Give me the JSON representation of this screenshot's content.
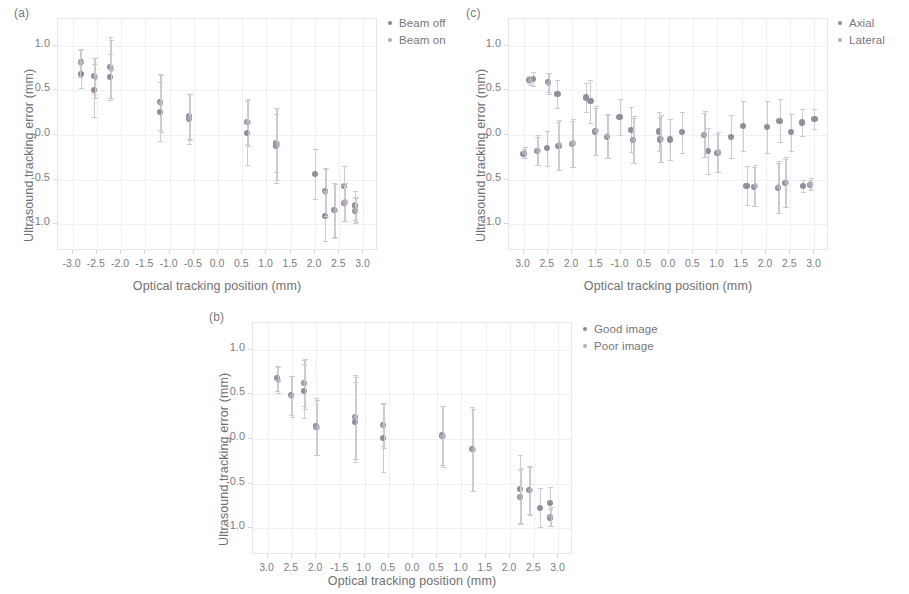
{
  "figure": {
    "colors": {
      "series_a": "#8e8795",
      "series_b": "#b6aec0",
      "errorbar": "#cfc9d4",
      "axis": "#e8e6ea",
      "grid": "#f1eff3",
      "text": "#6f6f76"
    }
  },
  "panels": [
    {
      "label": "(a)",
      "legend": [
        "Beam off",
        "Beam on"
      ]
    },
    {
      "label": "(b)",
      "legend": [
        "Good image",
        "Poor image"
      ]
    },
    {
      "label": "(c)",
      "legend": [
        "Axial",
        "Lateral"
      ]
    }
  ],
  "chart_data": [
    {
      "panel": "(a)",
      "type": "scatter",
      "title": "(a)",
      "xlabel": "Optical tracking position (mm)",
      "ylabel": "Ultrasound tracking error (mm)",
      "xlim": [
        -3.3,
        3.3
      ],
      "ylim": [
        -1.3,
        1.3
      ],
      "xticks": [
        -3.0,
        -2.5,
        -2.0,
        -1.5,
        -1.0,
        -0.5,
        0.0,
        0.5,
        1.0,
        1.5,
        2.0,
        2.5,
        3.0
      ],
      "xticklabels": [
        "-3.0",
        "-2.5",
        "-2.0",
        "-1.5",
        "-1.0",
        "-0.5",
        "0.0",
        "0.5",
        "1.0",
        "1.5",
        "2.0",
        "2.5",
        "3.0"
      ],
      "yticks": [
        1.0,
        0.5,
        0.0,
        -0.5,
        -1.0
      ],
      "yticklabels": [
        "1.0",
        "0.5",
        "0.0",
        "-0.5",
        "-1.0"
      ],
      "grid": true,
      "legend_position": "outside-right-top",
      "series": [
        {
          "name": "Beam off",
          "color": "#8e8795",
          "points": [
            {
              "x": -2.82,
              "y": 0.82,
              "err": 0.14
            },
            {
              "x": -2.82,
              "y": 0.68,
              "err": 0.15
            },
            {
              "x": -2.55,
              "y": 0.66,
              "err": 0.2
            },
            {
              "x": -2.55,
              "y": 0.5,
              "err": 0.3
            },
            {
              "x": -2.22,
              "y": 0.76,
              "err": 0.34
            },
            {
              "x": -2.22,
              "y": 0.65,
              "err": 0.26
            },
            {
              "x": -1.2,
              "y": 0.37,
              "err": 0.31
            },
            {
              "x": -1.2,
              "y": 0.26,
              "err": 0.33
            },
            {
              "x": -0.6,
              "y": 0.21,
              "err": 0.25
            },
            {
              "x": -0.6,
              "y": 0.18,
              "err": 0.28
            },
            {
              "x": 0.6,
              "y": 0.15,
              "err": 0.25
            },
            {
              "x": 0.6,
              "y": 0.02,
              "err": 0.36
            },
            {
              "x": 1.2,
              "y": -0.09,
              "err": 0.33
            },
            {
              "x": 1.2,
              "y": -0.12,
              "err": 0.42
            },
            {
              "x": 2.0,
              "y": -0.44,
              "err": 0.28
            },
            {
              "x": 2.2,
              "y": -0.63,
              "err": 0.25
            },
            {
              "x": 2.2,
              "y": -0.91,
              "err": 0.28
            },
            {
              "x": 2.4,
              "y": -0.84,
              "err": 0.3
            },
            {
              "x": 2.6,
              "y": -0.57,
              "err": 0.22
            },
            {
              "x": 2.6,
              "y": -0.76,
              "err": 0.2
            },
            {
              "x": 2.82,
              "y": -0.79,
              "err": 0.16
            },
            {
              "x": 2.82,
              "y": -0.85,
              "err": 0.14
            }
          ]
        },
        {
          "name": "Beam on",
          "color": "#b6aec0",
          "points": [
            {
              "x": -2.84,
              "y": 0.8,
              "err": 0.15
            },
            {
              "x": -2.53,
              "y": 0.64,
              "err": 0.22
            },
            {
              "x": -2.2,
              "y": 0.74,
              "err": 0.33
            },
            {
              "x": -1.18,
              "y": 0.35,
              "err": 0.32
            },
            {
              "x": -0.58,
              "y": 0.2,
              "err": 0.26
            },
            {
              "x": 0.62,
              "y": 0.14,
              "err": 0.26
            },
            {
              "x": 1.22,
              "y": -0.1,
              "err": 0.4
            },
            {
              "x": 2.22,
              "y": -0.64,
              "err": 0.27
            },
            {
              "x": 2.42,
              "y": -0.85,
              "err": 0.3
            },
            {
              "x": 2.62,
              "y": -0.75,
              "err": 0.21
            },
            {
              "x": 2.84,
              "y": -0.84,
              "err": 0.14
            }
          ]
        }
      ]
    },
    {
      "panel": "(b)",
      "type": "scatter",
      "title": "(b)",
      "xlabel": "Optical tracking position (mm)",
      "ylabel": "Ultrasound tracking error (mm)",
      "xlim": [
        -3.3,
        3.3
      ],
      "ylim": [
        -1.3,
        1.3
      ],
      "xticks": [
        -3.0,
        -2.5,
        -2.0,
        -1.5,
        -1.0,
        -0.5,
        0.0,
        0.5,
        1.0,
        1.5,
        2.0,
        2.5,
        3.0
      ],
      "xticklabels": [
        "3.0",
        "2.5",
        "2.0",
        "-1.5",
        "1.0",
        "0.5",
        "0.0",
        "0.5",
        "1.0",
        "1.5",
        "2.0",
        "2.5",
        "3.0"
      ],
      "yticks": [
        1.0,
        0.5,
        0.0,
        -0.5,
        -1.0
      ],
      "yticklabels": [
        "1.0",
        "0.5",
        "0.0",
        "-0.5",
        "-1.0"
      ],
      "grid": true,
      "legend_position": "outside-right-top",
      "series": [
        {
          "name": "Good image",
          "color": "#8e8795",
          "points": [
            {
              "x": -2.8,
              "y": 0.68,
              "err": 0.14
            },
            {
              "x": -2.52,
              "y": 0.49,
              "err": 0.22
            },
            {
              "x": -2.25,
              "y": 0.63,
              "err": 0.26
            },
            {
              "x": -2.25,
              "y": 0.54,
              "err": 0.3
            },
            {
              "x": -2.0,
              "y": 0.14,
              "err": 0.32
            },
            {
              "x": -1.2,
              "y": 0.25,
              "err": 0.47
            },
            {
              "x": -1.2,
              "y": 0.19,
              "err": 0.45
            },
            {
              "x": -0.62,
              "y": 0.16,
              "err": 0.24
            },
            {
              "x": -0.62,
              "y": 0.01,
              "err": 0.38
            },
            {
              "x": 0.6,
              "y": 0.04,
              "err": 0.33
            },
            {
              "x": 1.22,
              "y": -0.11,
              "err": 0.47
            },
            {
              "x": 2.2,
              "y": -0.56,
              "err": 0.38
            },
            {
              "x": 2.2,
              "y": -0.65,
              "err": 0.3
            },
            {
              "x": 2.4,
              "y": -0.57,
              "err": 0.27
            },
            {
              "x": 2.62,
              "y": -0.77,
              "err": 0.22
            },
            {
              "x": 2.82,
              "y": -0.72,
              "err": 0.18
            },
            {
              "x": 2.82,
              "y": -0.88,
              "err": 0.1
            }
          ]
        },
        {
          "name": "Poor image",
          "color": "#b6aec0",
          "points": [
            {
              "x": -2.78,
              "y": 0.66,
              "err": 0.15
            },
            {
              "x": -2.5,
              "y": 0.48,
              "err": 0.23
            },
            {
              "x": -2.23,
              "y": 0.62,
              "err": 0.28
            },
            {
              "x": -1.98,
              "y": 0.13,
              "err": 0.31
            },
            {
              "x": -1.18,
              "y": 0.24,
              "err": 0.46
            },
            {
              "x": -0.6,
              "y": 0.15,
              "err": 0.25
            },
            {
              "x": 0.62,
              "y": 0.03,
              "err": 0.34
            },
            {
              "x": 1.24,
              "y": -0.12,
              "err": 0.46
            },
            {
              "x": 2.22,
              "y": -0.64,
              "err": 0.31
            },
            {
              "x": 2.42,
              "y": -0.58,
              "err": 0.27
            },
            {
              "x": 2.84,
              "y": -0.87,
              "err": 0.11
            }
          ]
        }
      ]
    },
    {
      "panel": "(c)",
      "type": "scatter",
      "title": "(c)",
      "xlabel": "Optical tracking position (mm)",
      "ylabel": "Ultrasound tracking error (mm)",
      "xlim": [
        -3.3,
        3.3
      ],
      "ylim": [
        -1.3,
        1.3
      ],
      "xticks": [
        -3.0,
        -2.5,
        -2.0,
        -1.5,
        -1.0,
        -0.5,
        0.0,
        0.5,
        1.0,
        1.5,
        2.0,
        2.5,
        3.0
      ],
      "xticklabels": [
        "3.0",
        "2.5",
        "2.0",
        "1.5",
        "-1.0",
        "0.5",
        "0.0",
        "0.5",
        "1.0",
        "1.5",
        "2.0",
        "2.5",
        "3.0"
      ],
      "yticks": [
        1.0,
        0.5,
        0.0,
        -0.5,
        -1.0
      ],
      "yticklabels": [
        "1.0",
        "0.5",
        "0.0",
        "0.5",
        "-1.0"
      ],
      "grid": true,
      "legend_position": "outside-right-top",
      "series": [
        {
          "name": "Axial",
          "color": "#8e8795",
          "points": [
            {
              "x": -3.0,
              "y": -0.21,
              "err": 0.05
            },
            {
              "x": -2.88,
              "y": 0.62,
              "err": 0.04
            },
            {
              "x": -2.8,
              "y": 0.63,
              "err": 0.08
            },
            {
              "x": -2.72,
              "y": -0.18,
              "err": 0.16
            },
            {
              "x": -2.52,
              "y": -0.15,
              "err": 0.2
            },
            {
              "x": -2.5,
              "y": 0.59,
              "err": 0.11
            },
            {
              "x": -2.3,
              "y": 0.46,
              "err": 0.16
            },
            {
              "x": -2.28,
              "y": -0.12,
              "err": 0.27
            },
            {
              "x": -2.0,
              "y": -0.1,
              "err": 0.26
            },
            {
              "x": -1.72,
              "y": 0.42,
              "err": 0.16
            },
            {
              "x": -1.62,
              "y": 0.38,
              "err": 0.24
            },
            {
              "x": -1.52,
              "y": 0.04,
              "err": 0.26
            },
            {
              "x": -1.28,
              "y": -0.02,
              "err": 0.24
            },
            {
              "x": -1.02,
              "y": 0.2,
              "err": 0.2
            },
            {
              "x": -0.78,
              "y": 0.06,
              "err": 0.25
            },
            {
              "x": -0.75,
              "y": -0.06,
              "err": 0.25
            },
            {
              "x": -0.2,
              "y": 0.04,
              "err": 0.22
            },
            {
              "x": -0.18,
              "y": -0.05,
              "err": 0.25
            },
            {
              "x": 0.02,
              "y": -0.05,
              "err": 0.23
            },
            {
              "x": 0.26,
              "y": 0.03,
              "err": 0.23
            },
            {
              "x": 0.72,
              "y": 0.0,
              "err": 0.25
            },
            {
              "x": 0.8,
              "y": -0.18,
              "err": 0.26
            },
            {
              "x": 1.0,
              "y": -0.2,
              "err": 0.21
            },
            {
              "x": 1.28,
              "y": -0.02,
              "err": 0.24
            },
            {
              "x": 1.52,
              "y": 0.1,
              "err": 0.28
            },
            {
              "x": 1.6,
              "y": -0.57,
              "err": 0.22
            },
            {
              "x": 1.76,
              "y": -0.58,
              "err": 0.22
            },
            {
              "x": 2.02,
              "y": 0.09,
              "err": 0.29
            },
            {
              "x": 2.24,
              "y": -0.59,
              "err": 0.28
            },
            {
              "x": 2.28,
              "y": 0.16,
              "err": 0.24
            },
            {
              "x": 2.4,
              "y": -0.54,
              "err": 0.27
            },
            {
              "x": 2.52,
              "y": 0.03,
              "err": 0.21
            },
            {
              "x": 2.74,
              "y": 0.14,
              "err": 0.15
            },
            {
              "x": 2.76,
              "y": -0.57,
              "err": 0.07
            },
            {
              "x": 2.9,
              "y": -0.56,
              "err": 0.06
            },
            {
              "x": 3.0,
              "y": 0.18,
              "err": 0.11
            }
          ]
        },
        {
          "name": "Lateral",
          "color": "#b6aec0",
          "points": [
            {
              "x": -2.98,
              "y": -0.2,
              "err": 0.06
            },
            {
              "x": -2.86,
              "y": 0.61,
              "err": 0.05
            },
            {
              "x": -2.7,
              "y": -0.17,
              "err": 0.17
            },
            {
              "x": -2.48,
              "y": 0.58,
              "err": 0.12
            },
            {
              "x": -2.26,
              "y": -0.11,
              "err": 0.28
            },
            {
              "x": -1.98,
              "y": -0.09,
              "err": 0.27
            },
            {
              "x": -1.5,
              "y": 0.05,
              "err": 0.27
            },
            {
              "x": -1.26,
              "y": -0.01,
              "err": 0.25
            },
            {
              "x": -0.73,
              "y": -0.05,
              "err": 0.26
            },
            {
              "x": -0.16,
              "y": -0.04,
              "err": 0.26
            },
            {
              "x": 0.74,
              "y": 0.01,
              "err": 0.26
            },
            {
              "x": 1.02,
              "y": -0.19,
              "err": 0.22
            },
            {
              "x": 1.78,
              "y": -0.57,
              "err": 0.23
            },
            {
              "x": 2.26,
              "y": -0.58,
              "err": 0.29
            },
            {
              "x": 2.42,
              "y": -0.53,
              "err": 0.28
            },
            {
              "x": 2.92,
              "y": -0.55,
              "err": 0.07
            }
          ]
        }
      ]
    }
  ]
}
